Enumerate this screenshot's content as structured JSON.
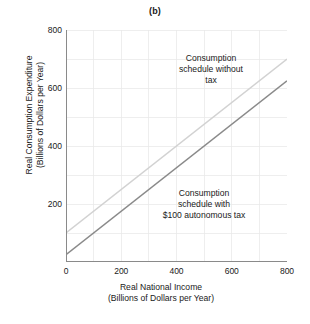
{
  "figure": {
    "title": "(b)"
  },
  "chart_data": {
    "type": "line",
    "title": "(b)",
    "xlabel": "Real National Income (Billions of Dollars per Year)",
    "ylabel": "Real Consumption Expenditure (Billions of Dollars per Year)",
    "xlabel_lines": [
      "Real National Income",
      "(Billions of Dollars per Year)"
    ],
    "ylabel_lines": [
      "Real Consumption Expenditure",
      "(Billions of Dollars per Year)"
    ],
    "xlim": [
      0,
      800
    ],
    "ylim": [
      0,
      800
    ],
    "xticks": [
      0,
      200,
      400,
      600,
      800
    ],
    "yticks": [
      200,
      400,
      600,
      800
    ],
    "xtick_labels": [
      "0",
      "200",
      "400",
      "600",
      "800"
    ],
    "ytick_labels": [
      "200",
      "400",
      "600",
      "800"
    ],
    "grid": true,
    "grid_interval": 100,
    "grid_color": "#e8e8e8",
    "axis_color": "#8a8a8a",
    "legend": "none",
    "series": [
      {
        "name": "Consumption schedule without tax",
        "color": "#d2d2d2",
        "intercept": 100,
        "slope": 0.75,
        "x": [
          0,
          800
        ],
        "values": [
          100,
          700
        ]
      },
      {
        "name": "Consumption schedule with $100 autonomous tax",
        "color": "#8a8a8a",
        "intercept": 25,
        "slope": 0.75,
        "x": [
          0,
          800
        ],
        "values": [
          25,
          625
        ]
      }
    ],
    "annotations": [
      {
        "id": "no-tax",
        "lines": [
          "Consumption",
          "schedule without",
          "tax"
        ],
        "x": 430,
        "y": 640
      },
      {
        "id": "with-tax",
        "lines": [
          "Consumption",
          "schedule with",
          "$100 autonomous tax"
        ],
        "x": 420,
        "y": 215
      }
    ]
  }
}
